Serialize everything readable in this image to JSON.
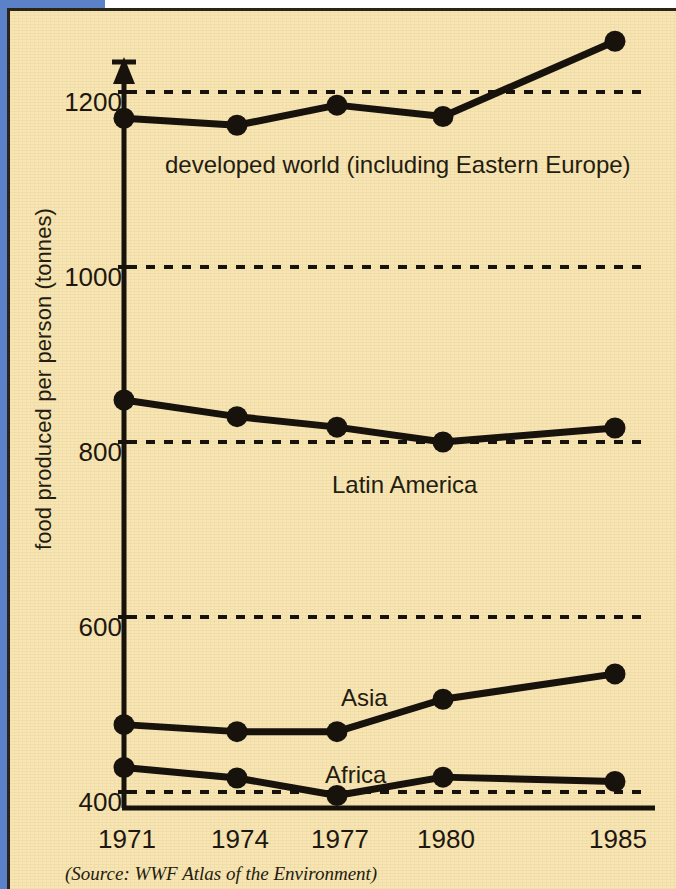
{
  "figure": {
    "background_color": "#f7e5b4",
    "ink_color": "#17120b",
    "page_edge_color": "#5b82c8",
    "source_note": "(Source: WWF Atlas of the Environment)"
  },
  "chart_data": {
    "type": "line",
    "title": "",
    "xlabel": "",
    "ylabel": "food produced per person (tonnes)",
    "x": [
      "1971",
      "1974",
      "1977",
      "1980",
      "1985"
    ],
    "xtick_labels": [
      "1971",
      "1974",
      "1977",
      "1980",
      "1985"
    ],
    "ytick_labels": [
      "400",
      "600",
      "800",
      "1000",
      "1200"
    ],
    "ytick_values": [
      400,
      600,
      800,
      1000,
      1200
    ],
    "ylim": [
      390,
      1290
    ],
    "grid": "horizontal dashed at each y tick",
    "legend": "inline labels next to each line",
    "marker": "filled circle",
    "series": [
      {
        "name": "developed world (including Eastern Europe)",
        "label": "developed world (including Eastern Europe)",
        "values": [
          1170,
          1162,
          1185,
          1172,
          1258
        ]
      },
      {
        "name": "Latin America",
        "label": "Latin America",
        "values": [
          848,
          829,
          817,
          800,
          816
        ]
      },
      {
        "name": "Asia",
        "label": "Asia",
        "values": [
          477,
          469,
          469,
          506,
          535
        ]
      },
      {
        "name": "Africa",
        "label": "Africa",
        "values": [
          428,
          416,
          396,
          417,
          412
        ]
      }
    ]
  }
}
